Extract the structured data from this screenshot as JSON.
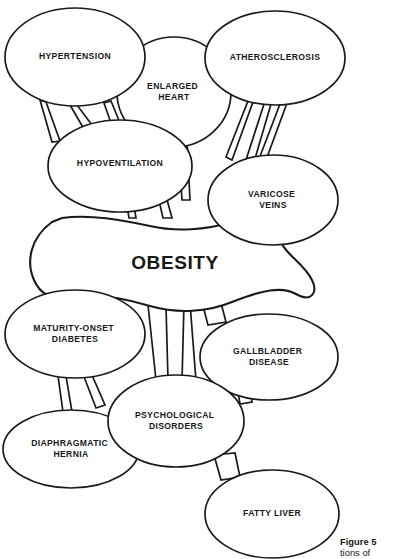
{
  "figure": {
    "central_node": {
      "label": "OBESITY",
      "cx": 175,
      "cy": 263
    },
    "caption": {
      "strong": "Figure 5",
      "rest": "tions of"
    },
    "colors": {
      "stroke": "#1a1a1a",
      "fill": "#ffffff",
      "text": "#17181a",
      "background": "#ffffff"
    },
    "nodes": [
      {
        "id": "hypertension",
        "label": "HYPERTENSION",
        "cx": 75,
        "cy": 57,
        "rx": 70,
        "ry": 49
      },
      {
        "id": "enlarged-heart",
        "label": "ENLARGED\nHEART",
        "cx": 174,
        "cy": 92,
        "rx": 57,
        "ry": 55
      },
      {
        "id": "atherosclerosis",
        "label": "ATHEROSCLEROSIS",
        "cx": 275,
        "cy": 58,
        "rx": 70,
        "ry": 47
      },
      {
        "id": "hypoventilation",
        "label": "HYPOVENTILATION",
        "cx": 120,
        "cy": 166,
        "rx": 72,
        "ry": 46
      },
      {
        "id": "varicose-veins",
        "label": "VARICOSE\nVEINS",
        "cx": 273,
        "cy": 200,
        "rx": 65,
        "ry": 45
      },
      {
        "id": "maturity-diabetes",
        "label": "MATURITY-ONSET\nDIABETES",
        "cx": 75,
        "cy": 334,
        "rx": 70,
        "ry": 44
      },
      {
        "id": "gallbladder",
        "label": "GALLBLADDER\nDISEASE",
        "cx": 269,
        "cy": 357,
        "rx": 69,
        "ry": 43
      },
      {
        "id": "psychological",
        "label": "PSYCHOLOGICAL\nDISORDERS",
        "cx": 176,
        "cy": 421,
        "rx": 68,
        "ry": 46
      },
      {
        "id": "diaphragmatic",
        "label": "DIAPHRAGMATIC\nHERNIA",
        "cx": 71,
        "cy": 449,
        "rx": 68,
        "ry": 39
      },
      {
        "id": "fatty-liver",
        "label": "FATTY LIVER",
        "cx": 272,
        "cy": 514,
        "rx": 67,
        "ry": 44
      }
    ],
    "connections": [
      {
        "from": "hypertension",
        "to": "hypoventilation"
      },
      {
        "from": "hypertension",
        "to": "hypoventilation"
      },
      {
        "from": "atherosclerosis",
        "to": "varicose-veins"
      },
      {
        "from": "atherosclerosis",
        "to": "varicose-veins"
      },
      {
        "from": "hypoventilation",
        "to": "obesity"
      },
      {
        "from": "enlarged-heart",
        "to": "obesity"
      },
      {
        "from": "maturity-diabetes",
        "to": "diaphragmatic"
      },
      {
        "from": "maturity-diabetes",
        "to": "diaphragmatic"
      },
      {
        "from": "obesity",
        "to": "psychological"
      },
      {
        "from": "obesity",
        "to": "gallbladder"
      },
      {
        "from": "psychological",
        "to": "fatty-liver"
      }
    ]
  }
}
